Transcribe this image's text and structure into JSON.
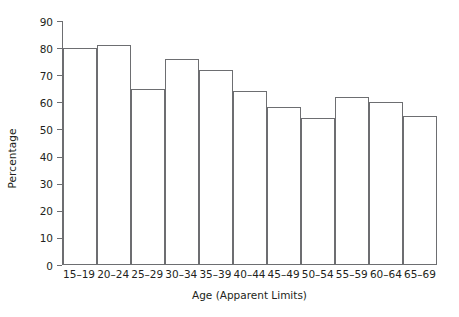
{
  "chart_data": {
    "type": "bar",
    "title": "",
    "xlabel": "Age (Apparent Limits)",
    "ylabel": "Percentage",
    "categories": [
      "15–19",
      "20–24",
      "25–29",
      "30–34",
      "35–39",
      "40–44",
      "45–49",
      "50–54",
      "55–59",
      "60–64",
      "65–69"
    ],
    "values": [
      80,
      81,
      65,
      76,
      72,
      64,
      58,
      54,
      62,
      60,
      55
    ],
    "ylim": [
      0,
      90
    ],
    "ytick_labels": [
      "0",
      "10",
      "20",
      "30",
      "40",
      "50",
      "60",
      "70",
      "80",
      "90"
    ],
    "ytick_values": [
      0,
      10,
      20,
      30,
      40,
      50,
      60,
      70,
      80,
      90
    ],
    "grid": false,
    "legend": false,
    "bar_fill": "#ffffff",
    "bar_edge_color": "#6d6e71",
    "axis_color": "#6d6e71",
    "text_color": "#231f20",
    "background": "#ffffff"
  }
}
